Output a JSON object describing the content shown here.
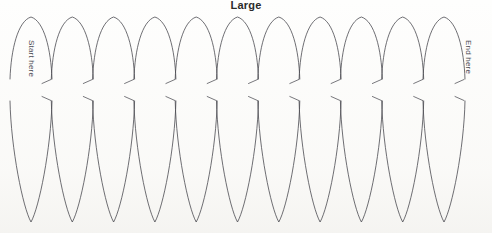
{
  "document": {
    "title": "Large",
    "kind": "petal-template-sheet",
    "background_color": "#fefefd",
    "line_color": "#4a4a50"
  },
  "labels": {
    "start": "Start here",
    "end": "End here"
  },
  "template": {
    "petal_count": 11,
    "top_peak_y": 17,
    "bottom_point_y": 222,
    "waist_top_y": 79,
    "waist_bottom_y": 101,
    "first_center_x": 31,
    "spacing_x": 41.3,
    "half_width": 21,
    "tick_count_top": 11,
    "tick_count_bottom": 11
  },
  "chart_data": {
    "type": "table",
    "title": "Large",
    "categories": [
      "petal-1",
      "petal-2",
      "petal-3",
      "petal-4",
      "petal-5",
      "petal-6",
      "petal-7",
      "petal-8",
      "petal-9",
      "petal-10",
      "petal-11"
    ],
    "values": [
      31,
      72,
      114,
      155,
      196,
      238,
      279,
      320,
      362,
      403,
      444
    ],
    "xlabel": "center x (px)",
    "ylabel": "",
    "notes": [
      "Start here",
      "End here"
    ]
  }
}
